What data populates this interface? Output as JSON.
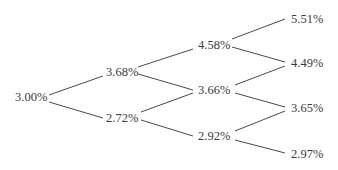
{
  "diagram": {
    "type": "binomial-interest-rate-tree",
    "levels": [
      {
        "nodes": [
          {
            "label": "3.00%"
          }
        ]
      },
      {
        "nodes": [
          {
            "label": "3.68%"
          },
          {
            "label": "2.72%"
          }
        ]
      },
      {
        "nodes": [
          {
            "label": "4.58%"
          },
          {
            "label": "3.66%"
          },
          {
            "label": "2.92%"
          }
        ]
      },
      {
        "nodes": [
          {
            "label": "5.51%"
          },
          {
            "label": "4.49%"
          },
          {
            "label": "3.65%"
          },
          {
            "label": "2.97%"
          }
        ]
      }
    ],
    "colors": {
      "text": "#3a3a3a",
      "line": "#4a4a4a",
      "background": "#ffffff"
    }
  }
}
